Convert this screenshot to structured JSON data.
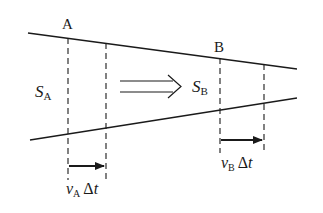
{
  "diagram": {
    "type": "fluid-flow-tube",
    "colors": {
      "stroke": "#1a1a1a",
      "background": "#ffffff"
    },
    "section_a": {
      "point_label": "A",
      "area_symbol": "S",
      "area_subscript": "A",
      "displacement": {
        "v": "v",
        "subscript": "A",
        "delta": "Δ",
        "t": "t"
      }
    },
    "section_b": {
      "point_label": "B",
      "area_symbol": "S",
      "area_subscript": "B",
      "displacement": {
        "v": "v",
        "subscript": "B",
        "delta": "Δ",
        "t": "t"
      }
    },
    "flow_arrow": "double-arrow-right"
  }
}
